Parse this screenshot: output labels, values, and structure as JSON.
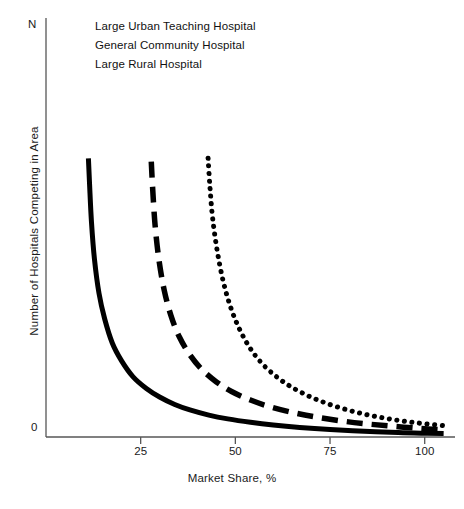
{
  "chart_data": {
    "type": "line",
    "title": "",
    "subtitle": "",
    "xlabel": "Market Share, %",
    "ylabel": "Number of Hospitals Competing in Area",
    "xlim": [
      0,
      108
    ],
    "ylim": [
      0,
      1
    ],
    "grid": false,
    "legend_position": "top-left",
    "xticks": [
      25,
      50,
      75,
      100
    ],
    "xtick_labels": [
      "25",
      "50",
      "75",
      "100"
    ],
    "yticks": [
      0,
      1
    ],
    "ytick_labels": [
      "0",
      "N"
    ],
    "y_axis_top_label": "N",
    "y_axis_zero_label": "0",
    "series": [
      {
        "name": "Large Urban Teaching Hospital",
        "style": "solid",
        "color": "#000000",
        "asymptote_x": 11,
        "x": [
          11.2,
          11.5,
          12,
          12.8,
          14,
          15.5,
          17.5,
          20,
          23,
          26.5,
          30,
          34,
          38,
          43,
          48,
          54,
          60,
          67,
          75,
          84,
          93,
          100,
          105
        ],
        "y": [
          0.815,
          0.74,
          0.63,
          0.52,
          0.42,
          0.345,
          0.275,
          0.222,
          0.176,
          0.142,
          0.117,
          0.095,
          0.079,
          0.064,
          0.053,
          0.043,
          0.035,
          0.028,
          0.022,
          0.017,
          0.013,
          0.011,
          0.01
        ]
      },
      {
        "name": "General Community Hospital",
        "style": "dashed",
        "color": "#000000",
        "asymptote_x": 27.5,
        "x": [
          27.8,
          28.2,
          28.8,
          29.8,
          31.2,
          33,
          35.2,
          38,
          41.2,
          45,
          49,
          54,
          59,
          65,
          71,
          78,
          85,
          92,
          99,
          105
        ],
        "y": [
          0.805,
          0.72,
          0.62,
          0.52,
          0.43,
          0.355,
          0.293,
          0.24,
          0.197,
          0.161,
          0.133,
          0.108,
          0.089,
          0.072,
          0.059,
          0.047,
          0.038,
          0.031,
          0.025,
          0.021
        ]
      },
      {
        "name": "Large Rural Hospital",
        "style": "dotted",
        "color": "#000000",
        "asymptote_x": 42.5,
        "x": [
          42.8,
          43.3,
          44,
          45.2,
          46.8,
          48.8,
          51.2,
          54,
          57.2,
          61,
          65,
          69.5,
          74,
          79,
          84,
          89,
          94,
          99,
          105
        ],
        "y": [
          0.815,
          0.73,
          0.64,
          0.545,
          0.455,
          0.378,
          0.313,
          0.258,
          0.213,
          0.175,
          0.145,
          0.119,
          0.099,
          0.081,
          0.067,
          0.056,
          0.047,
          0.04,
          0.033
        ]
      }
    ]
  },
  "legend": {
    "items": [
      {
        "label": "Large Urban Teaching Hospital",
        "style": "solid"
      },
      {
        "label": "General Community Hospital",
        "style": "dashed"
      },
      {
        "label": "Large Rural Hospital",
        "style": "dotted"
      }
    ]
  },
  "axes": {
    "x_label": "Market Share, %",
    "y_label": "Number of Hospitals Competing in Area",
    "x_tick_labels": [
      "25",
      "50",
      "75",
      "100"
    ],
    "y_top_label": "N",
    "y_zero_label": "0"
  },
  "colors": {
    "line": "#000000",
    "axis": "#4a4a4a",
    "text": "#1a1a1a",
    "background": "#ffffff"
  }
}
